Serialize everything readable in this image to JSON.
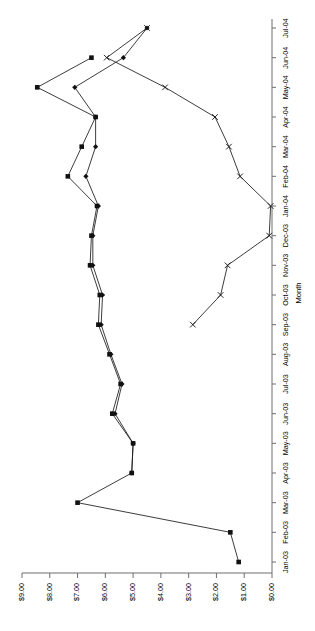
{
  "chart_data": {
    "type": "line",
    "title": "",
    "subtitle": "",
    "orientation": "rotated-90-ccw",
    "xlabel": "Month",
    "ylabel": "",
    "grid": false,
    "legend": "none",
    "categories": [
      "Jan-03",
      "Feb-03",
      "Mar-03",
      "Apr-03",
      "May-03",
      "Jun-03",
      "Jul-03",
      "Aug-03",
      "Sep-03",
      "Oct-03",
      "Nov-03",
      "Dec-03",
      "Jan-04",
      "Feb-04",
      "Mar-04",
      "Apr-04",
      "May-04",
      "Jun-04",
      "Jul-04"
    ],
    "x_tick_labels": [
      "Jan-03",
      "Feb-03",
      "Mar-03",
      "Apr-03",
      "May-03",
      "Jun-03",
      "Jul-03",
      "Aug-03",
      "Sep-03",
      "Oct-03",
      "Nov-03",
      "Dec-03",
      "Jan-04",
      "Feb-04",
      "Mar-04",
      "Apr-04",
      "May-04",
      "Jun-04",
      "Jul-04"
    ],
    "y_tick_labels": [
      "$0.00",
      "$1.00",
      "$2.00",
      "$3.00",
      "$4.00",
      "$5.00",
      "$6.00",
      "$7.00",
      "$8.00",
      "$9.00"
    ],
    "y_tick_values": [
      0,
      1,
      2,
      3,
      4,
      5,
      6,
      7,
      8,
      9
    ],
    "ylim": [
      0,
      9
    ],
    "series": [
      {
        "name": "series-1",
        "marker": "square",
        "values": [
          1.2,
          1.5,
          7.0,
          5.05,
          5.0,
          5.75,
          5.45,
          5.85,
          6.25,
          6.2,
          6.55,
          6.5,
          6.3,
          7.35,
          6.85,
          6.35,
          8.45,
          6.5,
          null
        ]
      },
      {
        "name": "series-2",
        "marker": "diamond",
        "values": [
          null,
          null,
          null,
          5.05,
          5.0,
          5.65,
          5.4,
          5.8,
          6.15,
          6.1,
          6.45,
          6.45,
          6.25,
          6.7,
          6.35,
          6.35,
          7.1,
          5.35,
          4.5
        ]
      },
      {
        "name": "series-3",
        "marker": "x",
        "values": [
          null,
          null,
          null,
          null,
          null,
          null,
          null,
          null,
          2.85,
          1.85,
          1.6,
          0.1,
          0.05,
          1.15,
          1.55,
          2.05,
          3.85,
          5.95,
          4.5
        ]
      }
    ]
  },
  "axes": {
    "x_axis_title": "Month",
    "x_axis_name": "month-axis",
    "y_axis_name": "dollar-value-axis"
  }
}
